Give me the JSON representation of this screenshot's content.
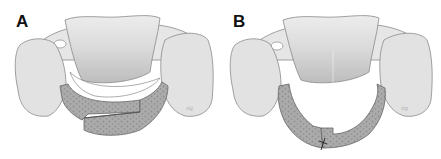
{
  "figure": {
    "panels": [
      {
        "label": "A",
        "subject": "vertebra-with-hinged-plate-closed",
        "description": "Cervical vertebra viewed from above with a two-piece perforated plate spanning the posterior arch, overlapping step joint at center"
      },
      {
        "label": "B",
        "subject": "vertebra-with-hinged-plate-opened",
        "description": "Cervical vertebra with plate opened into a U shape, joint at the bottom marked with a suture/cross mark"
      }
    ],
    "colors": {
      "bone_light": "#e4e4e4",
      "bone_shadow": "#bdbdbd",
      "bone_outline": "#8a8a8a",
      "plate_fill": "#a9a9a9",
      "plate_dots": "#8c8c8c",
      "label": "#111111"
    }
  }
}
